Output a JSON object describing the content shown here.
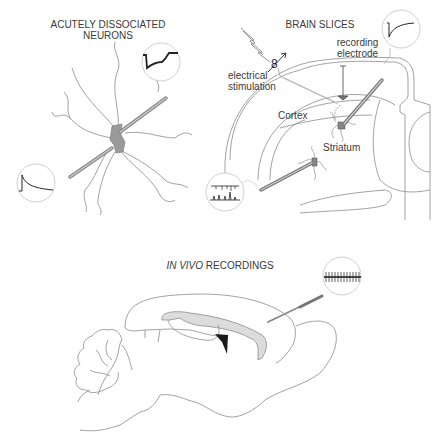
{
  "panels": {
    "dissociated": {
      "title_line1": "ACUTELY DISSOCIATED",
      "title_line2": "NEURONS"
    },
    "slices": {
      "title": "BRAIN SLICES",
      "labels": {
        "recording_line1": "recording",
        "recording_line2": "electrode",
        "stim_line1": "electrical",
        "stim_line2": "stimulation",
        "cortex": "Cortex",
        "striatum": "Striatum"
      }
    },
    "invivo": {
      "title_italic": "IN VIVO",
      "title_rest": " RECORDINGS"
    }
  },
  "colors": {
    "line": "#8a8a8a",
    "dark": "#222222",
    "soma": "#9a9a9a",
    "ventricle": "#dcdcdc",
    "circle": "#cfcfcf"
  }
}
